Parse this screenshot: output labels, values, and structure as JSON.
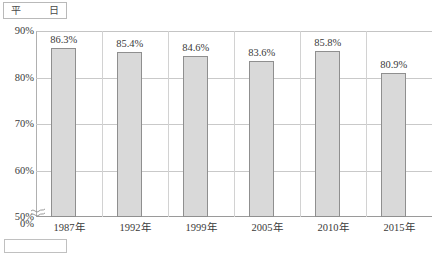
{
  "header": {
    "box_left_label": "平",
    "box_right_label": "日"
  },
  "footer": {
    "box_label": ""
  },
  "chart_data": {
    "type": "bar",
    "title": "",
    "subtitle": "",
    "xlabel": "",
    "ylabel": "",
    "categories": [
      "1987年",
      "1992年",
      "1999年",
      "2005年",
      "2010年",
      "2015年"
    ],
    "values": [
      86.3,
      85.4,
      84.6,
      83.6,
      85.8,
      80.9
    ],
    "value_labels": [
      "86.3%",
      "85.4%",
      "84.6%",
      "83.6%",
      "85.8%",
      "80.9%"
    ],
    "ylim": [
      50,
      90
    ],
    "y_ticks": [
      90,
      80,
      70,
      60,
      50,
      0
    ],
    "y_tick_labels": [
      "90%",
      "80%",
      "70%",
      "60%",
      "50%",
      "0%"
    ],
    "axis_break": true,
    "axis_break_between": [
      50,
      0
    ],
    "grid": "horizontal",
    "legend": "none",
    "colors": {
      "bar_fill": "#d9d9d9",
      "bar_border": "#8f8f8f",
      "gridline": "#c9c9c9",
      "axis": "#9a9a9a",
      "text": "#3a3a3a"
    }
  }
}
